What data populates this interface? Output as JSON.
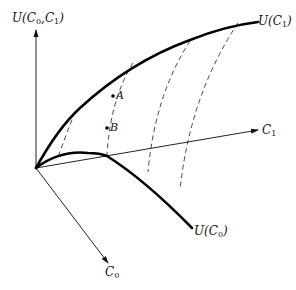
{
  "figure": {
    "type": "3d utility surface diagram",
    "axes": {
      "vertical": {
        "label_main": "U(C",
        "label_sub0": "0",
        "label_mid": ",C",
        "label_sub1": "1",
        "label_end": ")"
      },
      "c1_axis": {
        "label_main": "C",
        "label_sub": "1"
      },
      "c0_axis": {
        "label_main": "C",
        "label_sub": "0"
      }
    },
    "curves": {
      "u_c1": {
        "label_main": "U(C",
        "label_sub": "1",
        "label_end": ")"
      },
      "u_c0": {
        "label_main": "U(C",
        "label_sub": "0",
        "label_end": ")"
      }
    },
    "points": [
      {
        "label": "A"
      },
      {
        "label": "B"
      }
    ],
    "dashed_lines_count": 4,
    "colors": {
      "ink": "#000000",
      "background": "#ffffff"
    }
  }
}
